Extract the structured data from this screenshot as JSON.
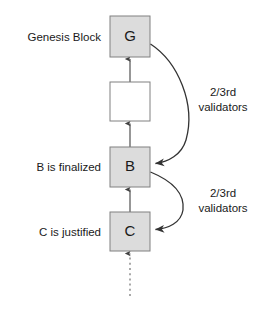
{
  "diagram": {
    "background_color": "#ffffff",
    "block_fill_shaded": "#dcdcdc",
    "block_fill_empty": "#ffffff",
    "block_stroke": "#808080",
    "arrow_color": "#333333"
  },
  "blocks": [
    {
      "id": "genesis",
      "letter": "G",
      "label": "Genesis Block",
      "fill": "#dcdcdc",
      "x": 110,
      "y": 16,
      "w": 40,
      "h": 41
    },
    {
      "id": "intermediate",
      "letter": "",
      "label": "",
      "fill": "#ffffff",
      "x": 110,
      "y": 82,
      "w": 40,
      "h": 39
    },
    {
      "id": "block-b",
      "letter": "B",
      "label": "B is finalized",
      "fill": "#dcdcdc",
      "x": 110,
      "y": 147,
      "w": 40,
      "h": 40
    },
    {
      "id": "block-c",
      "letter": "C",
      "label": "C is justified",
      "fill": "#dcdcdc",
      "x": 110,
      "y": 212,
      "w": 40,
      "h": 39
    }
  ],
  "annotations": [
    {
      "id": "validators-upper",
      "line1": "2/3rd",
      "line2": "validators",
      "x": 223,
      "y": 96
    },
    {
      "id": "validators-lower",
      "line1": "2/3rd",
      "line2": "validators",
      "x": 223,
      "y": 197
    }
  ],
  "edges": {
    "parent_links": [
      {
        "id": "link-intermediate-to-genesis",
        "from": "intermediate",
        "to": "genesis"
      },
      {
        "id": "link-b-to-intermediate",
        "from": "block-b",
        "to": "intermediate"
      },
      {
        "id": "link-c-to-b",
        "from": "block-c",
        "to": "block-b"
      }
    ],
    "pending_link": {
      "id": "link-pending-to-c",
      "style": "dotted",
      "to": "block-c"
    },
    "supermajority_links": [
      {
        "id": "supermajority-genesis-to-b",
        "from": "genesis",
        "to": "block-b",
        "label": "2/3rd validators"
      },
      {
        "id": "supermajority-b-to-c",
        "from": "block-b",
        "to": "block-c",
        "label": "2/3rd validators"
      }
    ]
  }
}
